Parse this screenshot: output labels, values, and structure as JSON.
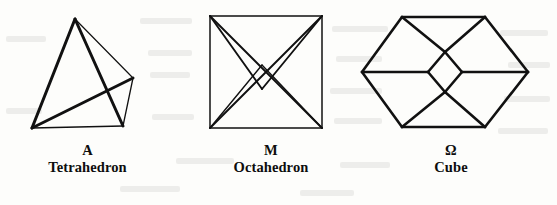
{
  "plate": {
    "background_color": "#fdfdfb",
    "ink_color": "#111111",
    "figure_count": 3
  },
  "figures": [
    {
      "id": "tetrahedron",
      "symbol": "A",
      "name": "Tetrahedron",
      "shape": "tetrahedron-wireframe",
      "vertices": {
        "apex": [
          75,
          19
        ],
        "bottom_left": [
          32,
          128
        ],
        "bottom_right": [
          123,
          126
        ],
        "right": [
          133,
          78
        ]
      },
      "edges": [
        [
          "apex",
          "bottom_left"
        ],
        [
          "apex",
          "bottom_right"
        ],
        [
          "apex",
          "right"
        ],
        [
          "bottom_left",
          "bottom_right"
        ],
        [
          "bottom_left",
          "right"
        ],
        [
          "bottom_right",
          "right"
        ]
      ]
    },
    {
      "id": "octahedron",
      "symbol": "M",
      "name": "Octahedron",
      "shape": "octahedron-wireframe",
      "vertices": {
        "top_left": [
          210,
          16
        ],
        "top_right": [
          322,
          16
        ],
        "bottom_right": [
          322,
          128
        ],
        "bottom_left": [
          210,
          128
        ],
        "inner_upper": [
          262,
          65
        ],
        "inner_lower": [
          262,
          89
        ]
      },
      "edges": [
        [
          "top_left",
          "top_right"
        ],
        [
          "top_right",
          "bottom_right"
        ],
        [
          "bottom_right",
          "bottom_left"
        ],
        [
          "bottom_left",
          "top_left"
        ],
        [
          "top_left",
          "inner_lower"
        ],
        [
          "top_right",
          "inner_lower"
        ],
        [
          "bottom_left",
          "inner_upper"
        ],
        [
          "bottom_right",
          "inner_upper"
        ],
        [
          "top_left",
          "bottom_right"
        ],
        [
          "top_right",
          "bottom_left"
        ]
      ]
    },
    {
      "id": "cube",
      "symbol": "Ω",
      "name": "Cube",
      "shape": "cube-wireframe",
      "vertices": {
        "left": [
          362,
          72
        ],
        "top_left": [
          402,
          17
        ],
        "top_right": [
          485,
          17
        ],
        "right": [
          528,
          72
        ],
        "bottom_right": [
          485,
          127
        ],
        "bottom_left": [
          402,
          127
        ],
        "center_top": [
          445,
          52
        ],
        "center_left": [
          428,
          72
        ],
        "center_right": [
          462,
          72
        ],
        "center_bottom": [
          445,
          92
        ]
      },
      "edges": [
        [
          "left",
          "top_left"
        ],
        [
          "top_left",
          "top_right"
        ],
        [
          "top_right",
          "right"
        ],
        [
          "right",
          "bottom_right"
        ],
        [
          "bottom_right",
          "bottom_left"
        ],
        [
          "bottom_left",
          "left"
        ],
        [
          "left",
          "center_left"
        ],
        [
          "center_right",
          "right"
        ],
        [
          "top_left",
          "center_top"
        ],
        [
          "center_top",
          "top_right"
        ],
        [
          "bottom_left",
          "center_bottom"
        ],
        [
          "center_bottom",
          "bottom_right"
        ],
        [
          "center_left",
          "center_top"
        ],
        [
          "center_top",
          "center_right"
        ],
        [
          "center_right",
          "center_bottom"
        ],
        [
          "center_bottom",
          "center_left"
        ]
      ]
    }
  ],
  "bleed_marks": [
    {
      "left": 6,
      "top": 36,
      "width": 40
    },
    {
      "left": 140,
      "top": 18,
      "width": 52
    },
    {
      "left": 148,
      "top": 50,
      "width": 44
    },
    {
      "left": 150,
      "top": 72,
      "width": 40
    },
    {
      "left": 6,
      "top": 108,
      "width": 36
    },
    {
      "left": 152,
      "top": 114,
      "width": 42
    },
    {
      "left": 176,
      "top": 158,
      "width": 58
    },
    {
      "left": 332,
      "top": 26,
      "width": 56
    },
    {
      "left": 336,
      "top": 56,
      "width": 46
    },
    {
      "left": 330,
      "top": 88,
      "width": 52
    },
    {
      "left": 334,
      "top": 118,
      "width": 48
    },
    {
      "left": 340,
      "top": 162,
      "width": 50
    },
    {
      "left": 500,
      "top": 30,
      "width": 48
    },
    {
      "left": 508,
      "top": 62,
      "width": 42
    },
    {
      "left": 504,
      "top": 96,
      "width": 46
    },
    {
      "left": 498,
      "top": 128,
      "width": 50
    },
    {
      "left": 120,
      "top": 186,
      "width": 60
    },
    {
      "left": 300,
      "top": 190,
      "width": 54
    }
  ]
}
